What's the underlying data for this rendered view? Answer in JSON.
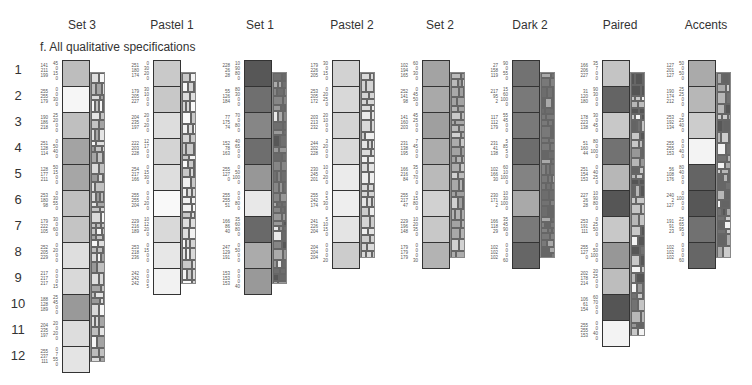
{
  "section_title": "f. All qualitative specifications",
  "row_numbers": [
    "1",
    "2",
    "3",
    "4",
    "5",
    "6",
    "7",
    "8",
    "9",
    "10",
    "11",
    "12"
  ],
  "schemes": [
    {
      "name": "Set 3",
      "colors": [
        {
          "rgb": [
            141,
            211,
            199
          ],
          "cmyk": [
            45,
            0,
            15,
            0
          ],
          "hex": "#8dd3c7"
        },
        {
          "rgb": [
            255,
            255,
            179
          ],
          "cmyk": [
            0,
            0,
            30,
            0
          ],
          "hex": "#ffffb3"
        },
        {
          "rgb": [
            190,
            186,
            218
          ],
          "cmyk": [
            25,
            20,
            0,
            0
          ],
          "hex": "#bebada"
        },
        {
          "rgb": [
            251,
            128,
            114
          ],
          "cmyk": [
            0,
            50,
            40,
            0
          ],
          "hex": "#fb8072"
        },
        {
          "rgb": [
            128,
            177,
            211
          ],
          "cmyk": [
            50,
            15,
            0,
            0
          ],
          "hex": "#80b1d3"
        },
        {
          "rgb": [
            253,
            180,
            98
          ],
          "cmyk": [
            0,
            30,
            55,
            0
          ],
          "hex": "#fdb462"
        },
        {
          "rgb": [
            179,
            222,
            105
          ],
          "cmyk": [
            30,
            0,
            60,
            0
          ],
          "hex": "#b3de69"
        },
        {
          "rgb": [
            252,
            205,
            229
          ],
          "cmyk": [
            0,
            20,
            0,
            0
          ],
          "hex": "#fccde5"
        },
        {
          "rgb": [
            217,
            217,
            217
          ],
          "cmyk": [
            0,
            0,
            0,
            15
          ],
          "hex": "#d9d9d9"
        },
        {
          "rgb": [
            188,
            128,
            189
          ],
          "cmyk": [
            25,
            45,
            0,
            0
          ],
          "hex": "#bc80bd"
        },
        {
          "rgb": [
            204,
            235,
            197
          ],
          "cmyk": [
            20,
            0,
            20,
            0
          ],
          "hex": "#ccebc5"
        },
        {
          "rgb": [
            255,
            237,
            111
          ],
          "cmyk": [
            0,
            7,
            55,
            0
          ],
          "hex": "#ffed6f"
        }
      ]
    },
    {
      "name": "Pastel 1",
      "colors": [
        {
          "rgb": [
            251,
            180,
            174
          ],
          "cmyk": [
            0,
            30,
            20,
            0
          ],
          "hex": "#fbb4ae"
        },
        {
          "rgb": [
            179,
            205,
            227
          ],
          "cmyk": [
            30,
            10,
            0,
            0
          ],
          "hex": "#b3cde3"
        },
        {
          "rgb": [
            204,
            235,
            197
          ],
          "cmyk": [
            20,
            0,
            20,
            0
          ],
          "hex": "#ccebc5"
        },
        {
          "rgb": [
            222,
            203,
            228
          ],
          "cmyk": [
            12,
            17,
            0,
            0
          ],
          "hex": "#decbe4"
        },
        {
          "rgb": [
            254,
            217,
            166
          ],
          "cmyk": [
            0,
            15,
            30,
            0
          ],
          "hex": "#fed9a6"
        },
        {
          "rgb": [
            255,
            255,
            204
          ],
          "cmyk": [
            0,
            0,
            20,
            0
          ],
          "hex": "#ffffcc"
        },
        {
          "rgb": [
            229,
            216,
            189
          ],
          "cmyk": [
            10,
            12,
            20,
            0
          ],
          "hex": "#e5d8bd"
        },
        {
          "rgb": [
            253,
            218,
            236
          ],
          "cmyk": [
            0,
            15,
            0,
            0
          ],
          "hex": "#fddaec"
        },
        {
          "rgb": [
            242,
            242,
            242
          ],
          "cmyk": [
            0,
            0,
            0,
            5
          ],
          "hex": "#f2f2f2"
        }
      ]
    },
    {
      "name": "Set 1",
      "colors": [
        {
          "rgb": [
            228,
            26,
            28
          ],
          "cmyk": [
            10,
            90,
            80,
            0
          ],
          "hex": "#e41a1c"
        },
        {
          "rgb": [
            55,
            126,
            184
          ],
          "cmyk": [
            80,
            30,
            0,
            0
          ],
          "hex": "#377eb8"
        },
        {
          "rgb": [
            77,
            175,
            74
          ],
          "cmyk": [
            70,
            0,
            80,
            0
          ],
          "hex": "#4daf4a"
        },
        {
          "rgb": [
            152,
            78,
            163
          ],
          "cmyk": [
            40,
            65,
            0,
            0
          ],
          "hex": "#984ea3"
        },
        {
          "rgb": [
            255,
            127,
            0
          ],
          "cmyk": [
            0,
            50,
            100,
            0
          ],
          "hex": "#ff7f00"
        },
        {
          "rgb": [
            255,
            255,
            51
          ],
          "cmyk": [
            0,
            0,
            80,
            0
          ],
          "hex": "#ffff33"
        },
        {
          "rgb": [
            166,
            86,
            40
          ],
          "cmyk": [
            35,
            60,
            80,
            0
          ],
          "hex": "#a65628"
        },
        {
          "rgb": [
            247,
            129,
            191
          ],
          "cmyk": [
            0,
            50,
            0,
            0
          ],
          "hex": "#f781bf"
        },
        {
          "rgb": [
            153,
            153,
            153
          ],
          "cmyk": [
            0,
            0,
            0,
            40
          ],
          "hex": "#999999"
        }
      ]
    },
    {
      "name": "Pastel 2",
      "colors": [
        {
          "rgb": [
            179,
            226,
            205
          ],
          "cmyk": [
            30,
            0,
            15,
            0
          ],
          "hex": "#b3e2cd"
        },
        {
          "rgb": [
            253,
            205,
            172
          ],
          "cmyk": [
            0,
            20,
            25,
            0
          ],
          "hex": "#fdcdac"
        },
        {
          "rgb": [
            203,
            213,
            232
          ],
          "cmyk": [
            20,
            10,
            0,
            0
          ],
          "hex": "#cbd5e8"
        },
        {
          "rgb": [
            244,
            202,
            228
          ],
          "cmyk": [
            3,
            20,
            0,
            0
          ],
          "hex": "#f4cae4"
        },
        {
          "rgb": [
            230,
            245,
            201
          ],
          "cmyk": [
            10,
            0,
            20,
            0
          ],
          "hex": "#e6f5c9"
        },
        {
          "rgb": [
            255,
            242,
            174
          ],
          "cmyk": [
            0,
            5,
            30,
            0
          ],
          "hex": "#fff2ae"
        },
        {
          "rgb": [
            241,
            226,
            204
          ],
          "cmyk": [
            5,
            10,
            15,
            0
          ],
          "hex": "#f1e2cc"
        },
        {
          "rgb": [
            204,
            204,
            204
          ],
          "cmyk": [
            0,
            0,
            0,
            20
          ],
          "hex": "#cccccc"
        }
      ]
    },
    {
      "name": "Set 2",
      "colors": [
        {
          "rgb": [
            102,
            194,
            165
          ],
          "cmyk": [
            60,
            0,
            30,
            0
          ],
          "hex": "#66c2a5"
        },
        {
          "rgb": [
            252,
            141,
            98
          ],
          "cmyk": [
            0,
            45,
            50,
            0
          ],
          "hex": "#fc8d62"
        },
        {
          "rgb": [
            141,
            160,
            203
          ],
          "cmyk": [
            45,
            25,
            0,
            0
          ],
          "hex": "#8da0cb"
        },
        {
          "rgb": [
            231,
            138,
            195
          ],
          "cmyk": [
            7,
            45,
            0,
            0
          ],
          "hex": "#e78ac3"
        },
        {
          "rgb": [
            166,
            216,
            84
          ],
          "cmyk": [
            35,
            0,
            70,
            0
          ],
          "hex": "#a6d854"
        },
        {
          "rgb": [
            255,
            217,
            47
          ],
          "cmyk": [
            0,
            15,
            80,
            0
          ],
          "hex": "#ffd92f"
        },
        {
          "rgb": [
            229,
            196,
            148
          ],
          "cmyk": [
            10,
            20,
            35,
            0
          ],
          "hex": "#e5c494"
        },
        {
          "rgb": [
            179,
            179,
            179
          ],
          "cmyk": [
            0,
            0,
            0,
            30
          ],
          "hex": "#b3b3b3"
        }
      ]
    },
    {
      "name": "Dark 2",
      "colors": [
        {
          "rgb": [
            27,
            158,
            119
          ],
          "cmyk": [
            90,
            0,
            55,
            0
          ],
          "hex": "#1b9e77"
        },
        {
          "rgb": [
            217,
            95,
            2
          ],
          "cmyk": [
            15,
            60,
            100,
            0
          ],
          "hex": "#d95f02"
        },
        {
          "rgb": [
            117,
            112,
            179
          ],
          "cmyk": [
            55,
            45,
            0,
            0
          ],
          "hex": "#7570b3"
        },
        {
          "rgb": [
            231,
            41,
            138
          ],
          "cmyk": [
            5,
            85,
            5,
            0
          ],
          "hex": "#e7298a"
        },
        {
          "rgb": [
            102,
            166,
            30
          ],
          "cmyk": [
            60,
            10,
            100,
            0
          ],
          "hex": "#66a61e"
        },
        {
          "rgb": [
            230,
            171,
            2
          ],
          "cmyk": [
            10,
            30,
            100,
            0
          ],
          "hex": "#e6ab02"
        },
        {
          "rgb": [
            166,
            118,
            29
          ],
          "cmyk": [
            35,
            45,
            90,
            0
          ],
          "hex": "#a6761d"
        },
        {
          "rgb": [
            102,
            102,
            102
          ],
          "cmyk": [
            0,
            0,
            0,
            60
          ],
          "hex": "#666666"
        }
      ]
    },
    {
      "name": "Paired",
      "colors": [
        {
          "rgb": [
            166,
            206,
            227
          ],
          "cmyk": [
            35,
            7,
            0,
            0
          ],
          "hex": "#a6cee3"
        },
        {
          "rgb": [
            31,
            120,
            180
          ],
          "cmyk": [
            90,
            30,
            0,
            0
          ],
          "hex": "#1f78b4"
        },
        {
          "rgb": [
            178,
            223,
            138
          ],
          "cmyk": [
            30,
            0,
            45,
            0
          ],
          "hex": "#b2df8a"
        },
        {
          "rgb": [
            51,
            160,
            44
          ],
          "cmyk": [
            80,
            0,
            100,
            0
          ],
          "hex": "#33a02c"
        },
        {
          "rgb": [
            251,
            154,
            153
          ],
          "cmyk": [
            0,
            40,
            25,
            0
          ],
          "hex": "#fb9a99"
        },
        {
          "rgb": [
            227,
            26,
            28
          ],
          "cmyk": [
            10,
            90,
            80,
            0
          ],
          "hex": "#e31a1c"
        },
        {
          "rgb": [
            253,
            191,
            111
          ],
          "cmyk": [
            0,
            25,
            50,
            0
          ],
          "hex": "#fdbf6f"
        },
        {
          "rgb": [
            255,
            127,
            0
          ],
          "cmyk": [
            0,
            50,
            100,
            0
          ],
          "hex": "#ff7f00"
        },
        {
          "rgb": [
            202,
            178,
            214
          ],
          "cmyk": [
            20,
            25,
            0,
            0
          ],
          "hex": "#cab2d6"
        },
        {
          "rgb": [
            106,
            61,
            154
          ],
          "cmyk": [
            60,
            70,
            0,
            0
          ],
          "hex": "#6a3d9a"
        },
        {
          "rgb": [
            255,
            255,
            153
          ],
          "cmyk": [
            0,
            0,
            40,
            0
          ],
          "hex": "#ffff99"
        }
      ]
    },
    {
      "name": "Accents",
      "colors": [
        {
          "rgb": [
            127,
            201,
            127
          ],
          "cmyk": [
            50,
            0,
            50,
            0
          ],
          "hex": "#7fc97f"
        },
        {
          "rgb": [
            190,
            174,
            212
          ],
          "cmyk": [
            25,
            25,
            0,
            0
          ],
          "hex": "#beaed4"
        },
        {
          "rgb": [
            253,
            192,
            134
          ],
          "cmyk": [
            0,
            25,
            40,
            0
          ],
          "hex": "#fdc086"
        },
        {
          "rgb": [
            255,
            255,
            153
          ],
          "cmyk": [
            0,
            0,
            40,
            0
          ],
          "hex": "#ffff99"
        },
        {
          "rgb": [
            56,
            108,
            176
          ],
          "cmyk": [
            80,
            40,
            0,
            0
          ],
          "hex": "#386cb0"
        },
        {
          "rgb": [
            240,
            2,
            127
          ],
          "cmyk": [
            0,
            100,
            0,
            0
          ],
          "hex": "#f0027f"
        },
        {
          "rgb": [
            191,
            91,
            23
          ],
          "cmyk": [
            25,
            65,
            95,
            0
          ],
          "hex": "#bf5b17"
        },
        {
          "rgb": [
            102,
            102,
            102
          ],
          "cmyk": [
            0,
            0,
            0,
            60
          ],
          "hex": "#666666"
        }
      ]
    }
  ]
}
